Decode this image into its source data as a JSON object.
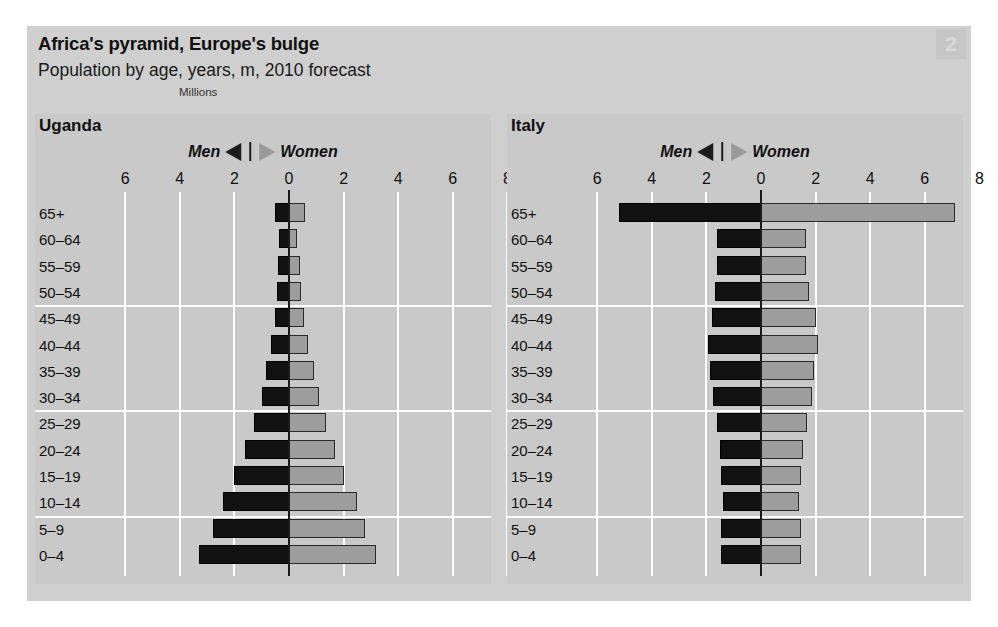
{
  "header": {
    "title": "Africa's pyramid, Europe's bulge",
    "subtitle": "Population by age, years, m, 2010 forecast",
    "units": "Millions",
    "page_number": "2"
  },
  "legend": {
    "men_label": "Men",
    "women_label": "Women",
    "men_marker": "left-triangle-icon",
    "women_marker": "right-triangle-icon"
  },
  "colors": {
    "figure_background": "#cfcfcf",
    "panel_background": "#c9c9c9",
    "men_bar": "#111111",
    "women_bar": "#9d9d9d",
    "gridline": "#ffffff",
    "axis_zero": "#1b1b1b"
  },
  "chart_data": [
    {
      "type": "bar",
      "title": "Uganda",
      "subtype": "population-pyramid",
      "xlabel": "Millions",
      "ylabel": "",
      "xlim": [
        -7,
        8
      ],
      "tick_labels": [
        "6",
        "4",
        "2",
        "0",
        "2",
        "4",
        "6",
        "8"
      ],
      "tick_values": [
        -6,
        -4,
        -2,
        0,
        2,
        4,
        6,
        8
      ],
      "grid": true,
      "legend_position": "top-center",
      "categories": [
        "65+",
        "60–64",
        "55–59",
        "50–54",
        "45–49",
        "40–44",
        "35–39",
        "30–34",
        "25–29",
        "20–24",
        "15–19",
        "10–14",
        "5–9",
        "0–4"
      ],
      "series": [
        {
          "name": "Men",
          "values": [
            0.5,
            0.35,
            0.4,
            0.45,
            0.5,
            0.65,
            0.85,
            1.0,
            1.3,
            1.6,
            2.0,
            2.4,
            2.8,
            3.3
          ]
        },
        {
          "name": "Women",
          "values": [
            0.6,
            0.3,
            0.4,
            0.45,
            0.55,
            0.7,
            0.9,
            1.1,
            1.35,
            1.7,
            2.0,
            2.5,
            2.8,
            3.2
          ]
        }
      ]
    },
    {
      "type": "bar",
      "title": "Italy",
      "subtype": "population-pyramid",
      "xlabel": "Millions",
      "ylabel": "",
      "xlim": [
        -7,
        8
      ],
      "tick_labels": [
        "6",
        "4",
        "2",
        "0",
        "2",
        "4",
        "6",
        "8"
      ],
      "tick_values": [
        -6,
        -4,
        -2,
        0,
        2,
        4,
        6,
        8
      ],
      "grid": true,
      "legend_position": "top-center",
      "categories": [
        "65+",
        "60–64",
        "55–59",
        "50–54",
        "45–49",
        "40–44",
        "35–39",
        "30–34",
        "25–29",
        "20–24",
        "15–19",
        "10–14",
        "5–9",
        "0–4"
      ],
      "series": [
        {
          "name": "Men",
          "values": [
            5.2,
            1.6,
            1.6,
            1.7,
            1.8,
            1.95,
            1.85,
            1.75,
            1.6,
            1.5,
            1.45,
            1.4,
            1.45,
            1.45
          ]
        },
        {
          "name": "Women",
          "values": [
            7.1,
            1.65,
            1.65,
            1.75,
            2.0,
            2.1,
            1.95,
            1.85,
            1.7,
            1.55,
            1.45,
            1.4,
            1.45,
            1.45
          ]
        }
      ]
    }
  ]
}
